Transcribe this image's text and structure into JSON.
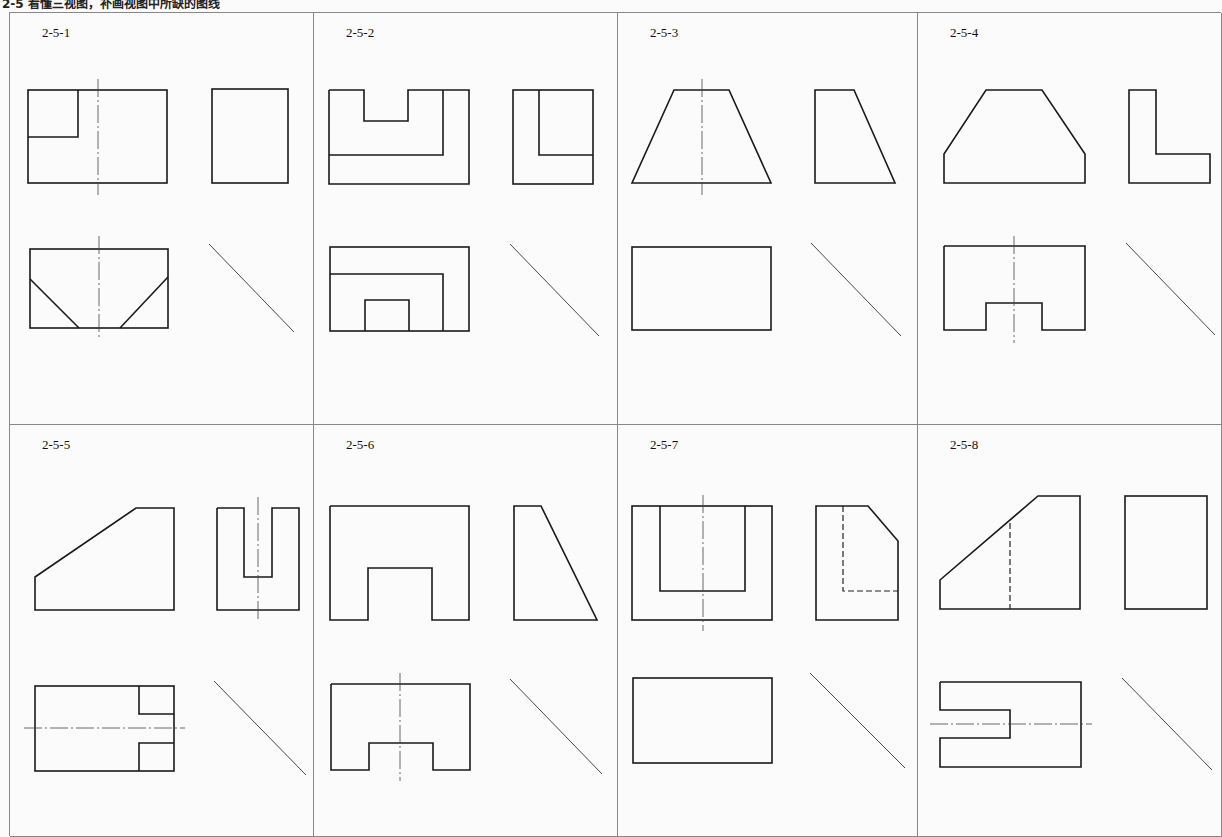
{
  "header": {
    "title": "2-5  看懂三视图，补画视图中所缺的图线"
  },
  "panels": [
    {
      "id": "2-5-1",
      "label": "2-5-1",
      "views": [
        "front",
        "side",
        "top",
        "miter-line"
      ]
    },
    {
      "id": "2-5-2",
      "label": "2-5-2",
      "views": [
        "front",
        "side",
        "top",
        "miter-line"
      ]
    },
    {
      "id": "2-5-3",
      "label": "2-5-3",
      "views": [
        "front",
        "side",
        "top",
        "miter-line"
      ]
    },
    {
      "id": "2-5-4",
      "label": "2-5-4",
      "views": [
        "front",
        "side",
        "top",
        "miter-line"
      ]
    },
    {
      "id": "2-5-5",
      "label": "2-5-5",
      "views": [
        "front",
        "side",
        "top",
        "miter-line"
      ]
    },
    {
      "id": "2-5-6",
      "label": "2-5-6",
      "views": [
        "front",
        "side",
        "top",
        "miter-line"
      ]
    },
    {
      "id": "2-5-7",
      "label": "2-5-7",
      "views": [
        "front",
        "side",
        "top",
        "miter-line"
      ]
    },
    {
      "id": "2-5-8",
      "label": "2-5-8",
      "views": [
        "front",
        "side",
        "top",
        "miter-line"
      ]
    }
  ],
  "colors": {
    "line": "#1a1a1a",
    "grid": "#888888",
    "paper": "#fbfbfb"
  }
}
